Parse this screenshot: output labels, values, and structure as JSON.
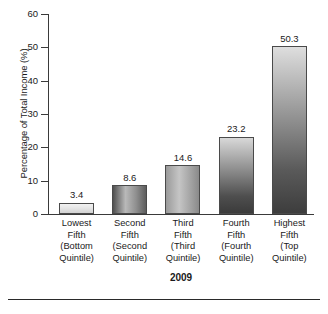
{
  "chart_data": {
    "type": "bar",
    "title": "",
    "subtitle": "",
    "xlabel": "2009",
    "ylabel": "Percentage of Total Income (%)",
    "categories": [
      "Lowest Fifth (Bottom Quintile)",
      "Second Fifth (Second Quintile)",
      "Third Fifth (Third Quintile)",
      "Fourth Fifth (Fourth Quintile)",
      "Highest Fifth (Top Quintile)"
    ],
    "category_lines": [
      [
        "Lowest",
        "Fifth",
        "(Bottom",
        "Quintile)"
      ],
      [
        "Second",
        "Fifth",
        "(Second",
        "Quintile)"
      ],
      [
        "Third",
        "Fifth",
        "(Third",
        "Quintile)"
      ],
      [
        "Fourth",
        "Fifth",
        "(Fourth",
        "Quintile)"
      ],
      [
        "Highest",
        "Fifth",
        "(Top",
        "Quintile)"
      ]
    ],
    "values": [
      3.4,
      8.6,
      14.6,
      23.2,
      50.3
    ],
    "value_labels": [
      "3.4",
      "8.6",
      "14.6",
      "23.2",
      "50.3"
    ],
    "ylim": [
      0,
      60
    ],
    "ytick_labels": [
      "0",
      "10",
      "20",
      "30",
      "40",
      "50",
      "60"
    ],
    "ytick_values": [
      0,
      10,
      20,
      30,
      40,
      50,
      60
    ],
    "grid": false,
    "legend": "none"
  }
}
